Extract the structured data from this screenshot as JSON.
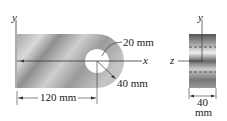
{
  "figure": {
    "front_view": {
      "y_axis_label": "y",
      "x_axis_label": "x",
      "hole_radius_label": "20 mm",
      "outer_radius_label": "40 mm",
      "length_label": "120 mm"
    },
    "side_view": {
      "y_axis_label": "y",
      "z_axis_label": "z",
      "thickness_value": "40",
      "thickness_unit": "mm"
    }
  }
}
